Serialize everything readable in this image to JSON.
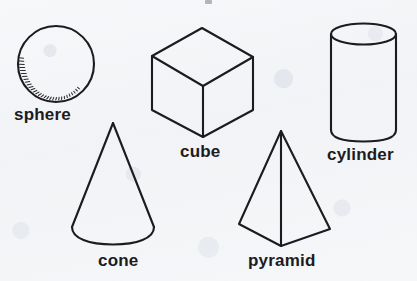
{
  "figure": {
    "kind": "geometric-solids-illustration",
    "background_color": "#f4f5f7",
    "ink_color": "#1c1c20",
    "width": 417,
    "height": 281,
    "top_crop_artifact": true,
    "shapes": [
      {
        "id": "sphere",
        "label": "sphere",
        "type": "sphere",
        "outline": "circle",
        "center": [
          56,
          64
        ],
        "radius": 38,
        "shading": "hatched arc along lower-left rim",
        "label_position": [
          14,
          106
        ]
      },
      {
        "id": "cube",
        "label": "cube",
        "type": "cube",
        "outline": "hexagonal silhouette with three visible faces",
        "vertices": {
          "top": [
            202,
            28
          ],
          "top_left": [
            152,
            56
          ],
          "top_right": [
            253,
            57
          ],
          "center": [
            203,
            86
          ],
          "bottom_left": [
            152,
            110
          ],
          "bottom_right": [
            253,
            110
          ],
          "bottom": [
            203,
            137
          ]
        },
        "label_position": [
          180,
          143
        ]
      },
      {
        "id": "cylinder",
        "label": "cylinder",
        "type": "cylinder",
        "outline": "full ellipse top, straight sides, arc bottom",
        "left": 331,
        "right": 396,
        "top_ellipse_center_y": 34,
        "ellipse_ry": 10,
        "bottom_y": 139,
        "label_position": [
          327,
          146
        ]
      },
      {
        "id": "cone",
        "label": "cone",
        "type": "cone",
        "outline": "apex with two slanted sides and arc base",
        "apex": [
          113,
          123
        ],
        "base_left": [
          72,
          228
        ],
        "base_right": [
          154,
          228
        ],
        "base_bottom_y": 243,
        "label_position": [
          98,
          252
        ]
      },
      {
        "id": "pyramid",
        "label": "pyramid",
        "type": "pyramid",
        "outline": "apex, two base corners, front bottom vertex, vertical front edge",
        "apex": [
          281,
          131
        ],
        "base_left": [
          239,
          224
        ],
        "base_right": [
          330,
          229
        ],
        "front_bottom": [
          281,
          246
        ],
        "label_position": [
          248,
          252
        ]
      }
    ]
  },
  "labels": {
    "sphere": "sphere",
    "cube": "cube",
    "cylinder": "cylinder",
    "cone": "cone",
    "pyramid": "pyramid"
  }
}
